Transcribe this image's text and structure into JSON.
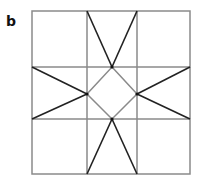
{
  "panel_label": "b",
  "diagram": {
    "type": "geometric-star-tiling",
    "outer_square": {
      "x": 32,
      "y": 11,
      "w": 158,
      "h": 163
    },
    "grid_lines": {
      "verticals": [
        87,
        137
      ],
      "horizontals": [
        67,
        119
      ]
    },
    "diamond": [
      [
        112,
        67
      ],
      [
        137,
        94
      ],
      [
        112,
        119
      ],
      [
        87,
        94
      ]
    ],
    "star_lines": [
      [
        [
          87,
          11
        ],
        [
          112,
          67
        ]
      ],
      [
        [
          137,
          11
        ],
        [
          112,
          67
        ]
      ],
      [
        [
          87,
          174
        ],
        [
          112,
          119
        ]
      ],
      [
        [
          137,
          174
        ],
        [
          112,
          119
        ]
      ],
      [
        [
          32,
          67
        ],
        [
          87,
          94
        ]
      ],
      [
        [
          32,
          119
        ],
        [
          87,
          94
        ]
      ],
      [
        [
          190,
          67
        ],
        [
          137,
          94
        ]
      ],
      [
        [
          190,
          119
        ],
        [
          137,
          94
        ]
      ]
    ],
    "colors": {
      "grid": "#8a8a8a",
      "star": "#222222",
      "diamond": "#8a8a8a"
    }
  }
}
